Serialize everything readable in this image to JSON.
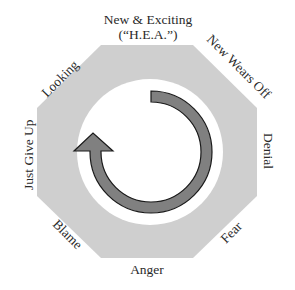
{
  "diagram": {
    "type": "cycle",
    "shape": "octagon",
    "colors": {
      "octagon_fill": "#cfcfcf",
      "inner_circle_fill": "#ffffff",
      "arrow_fill": "#808080",
      "arrow_stroke": "#1a1a1a",
      "label_color": "#2a2a2a"
    },
    "arrow_direction": "clockwise",
    "stages": [
      {
        "label_line1": "New & Exciting",
        "label_line2": "(“H.E.A.”)",
        "position": "top"
      },
      {
        "label": "New Wears Off",
        "position": "top-right"
      },
      {
        "label": "Denial",
        "position": "right"
      },
      {
        "label": "Fear",
        "position": "bottom-right"
      },
      {
        "label": "Anger",
        "position": "bottom"
      },
      {
        "label": "Blame",
        "position": "bottom-left"
      },
      {
        "label": "Just Give Up",
        "position": "left"
      },
      {
        "label": "Looking",
        "position": "top-left"
      }
    ]
  }
}
